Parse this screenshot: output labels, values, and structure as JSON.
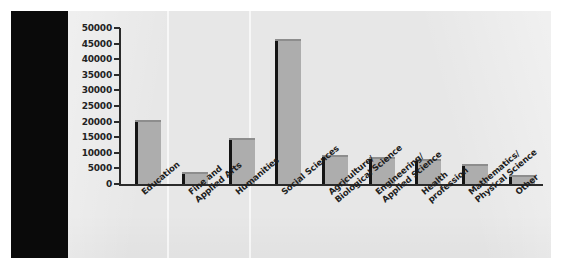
{
  "chart_data": {
    "type": "bar",
    "title": "",
    "subtitle": "",
    "xlabel": "",
    "ylabel": "",
    "ylim": [
      0,
      50000
    ],
    "ytick_step": 5000,
    "grid": false,
    "legend": null,
    "categories": [
      "Education",
      "Fine and\nApplied Arts",
      "Humanities",
      "Social Sciences",
      "Agriculture/\nBiological Science",
      "Engineering/\nApplied Science",
      "Health\nprofession",
      "Mathematics/\nPhysical Science",
      "Other"
    ],
    "values": [
      20500,
      3800,
      14800,
      46500,
      9300,
      8500,
      8000,
      6400,
      2800
    ],
    "ytick_labels": [
      "50000",
      "45000",
      "40000",
      "35000",
      "30000",
      "25000",
      "20000",
      "15000",
      "10000",
      "5000",
      "0"
    ],
    "ytick_values": [
      50000,
      45000,
      40000,
      35000,
      30000,
      25000,
      20000,
      15000,
      10000,
      5000,
      0
    ],
    "colors": {
      "bar_fill": "#adadad",
      "bar_edge": "#141414",
      "axis": "#2b2b2b",
      "text": "#1d1d1d",
      "panel_background": "#e7e7e7",
      "page_background": "#ffffff",
      "artifact_block": "#0a0a0a"
    }
  }
}
